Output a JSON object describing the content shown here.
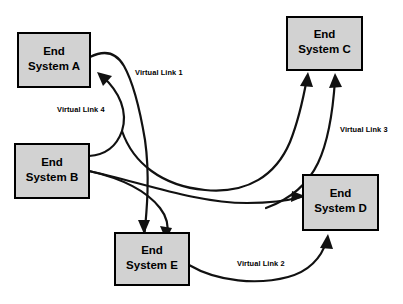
{
  "diagram": {
    "background_color": "#ffffff",
    "node_fill_color": "#d2d2d2",
    "node_border_color": "#000000",
    "link_color": "#111111",
    "nodes": [
      {
        "id": "A",
        "line1": "End",
        "line2": "System A",
        "x": 18,
        "y": 33,
        "w": 72,
        "h": 54
      },
      {
        "id": "C",
        "line1": "End",
        "line2": "System C",
        "x": 287,
        "y": 17,
        "w": 75,
        "h": 53
      },
      {
        "id": "B",
        "line1": "End",
        "line2": "System B",
        "x": 15,
        "y": 144,
        "w": 74,
        "h": 54
      },
      {
        "id": "D",
        "line1": "End",
        "line2": "System D",
        "x": 303,
        "y": 175,
        "w": 75,
        "h": 55
      },
      {
        "id": "E",
        "line1": "End",
        "line2": "System E",
        "x": 115,
        "y": 233,
        "w": 74,
        "h": 52
      }
    ],
    "links": [
      {
        "id": "vl1",
        "label": "Virtual Link 1",
        "label_x": 135,
        "label_y": 73,
        "from": "A",
        "to": "E"
      },
      {
        "id": "vl2",
        "label": "Virtual Link 2",
        "label_x": 237,
        "label_y": 264,
        "from": "E",
        "to": "D"
      },
      {
        "id": "vl3",
        "label": "Virtual Link 3",
        "label_x": 340,
        "label_y": 130,
        "from": "D",
        "to": "C"
      },
      {
        "id": "vl4",
        "label": "Virtual Link 4",
        "label_x": 57,
        "label_y": 110,
        "from": "B",
        "to": "A"
      },
      {
        "id": "vl5",
        "label": "",
        "from": "B",
        "to": "C"
      },
      {
        "id": "vl6",
        "label": "",
        "from": "B",
        "to": "D"
      },
      {
        "id": "vl7",
        "label": "",
        "from": "B",
        "to": "E"
      }
    ]
  }
}
